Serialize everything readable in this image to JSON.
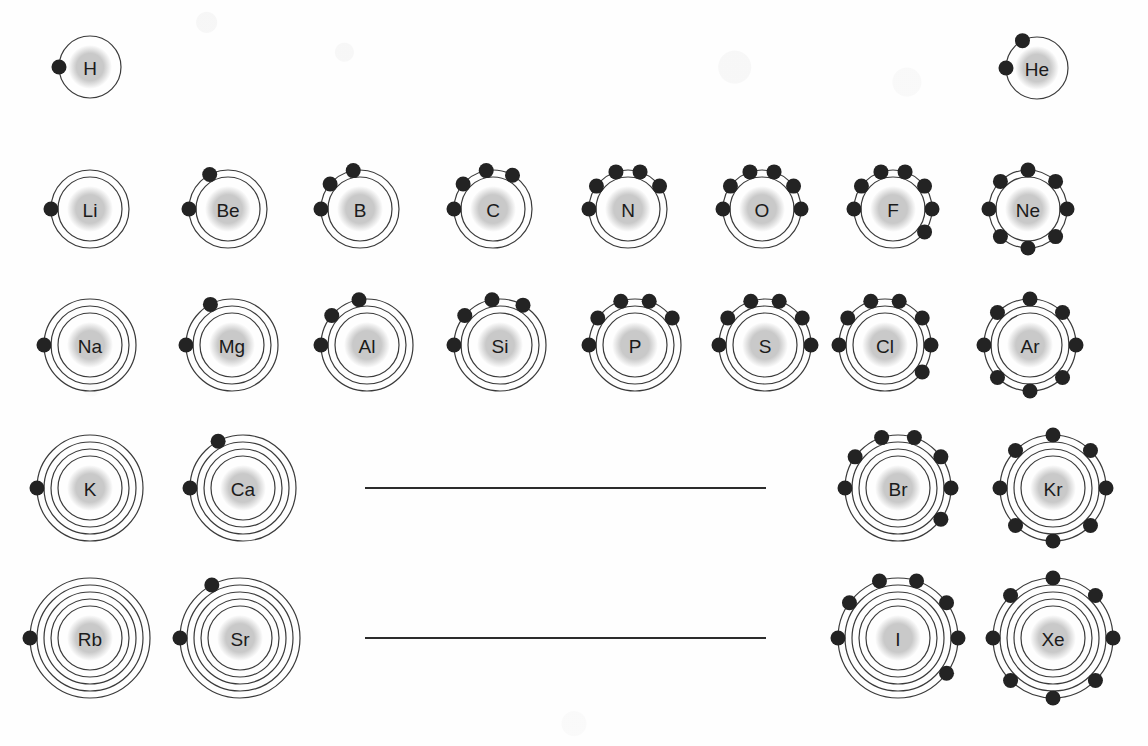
{
  "figure": {
    "kind": "bohr-model-periodic-table",
    "background_color": "#fefefe",
    "nucleus_color": "#c9c9c9",
    "shell_color": "#3a3a3a",
    "electron_color": "#232323",
    "symbol_color": "#1b1b1b",
    "divider_color": "#2c2c2c"
  },
  "dividers": [
    {
      "name": "period-4-transition-gap",
      "x1": 365,
      "x2": 766,
      "y": 488
    },
    {
      "name": "period-5-transition-gap",
      "x1": 365,
      "x2": 766,
      "y": 638
    }
  ],
  "atoms": [
    {
      "symbol": "H",
      "cx": 90,
      "cy": 67,
      "shells": [
        1
      ],
      "nucleus_r": 22,
      "shell_radii": [
        31
      ],
      "font_size": 19
    },
    {
      "symbol": "He",
      "cx": 1037,
      "cy": 68,
      "shells": [
        2
      ],
      "nucleus_r": 22,
      "shell_radii": [
        31
      ],
      "font_size": 19
    },
    {
      "symbol": "Li",
      "cx": 90,
      "cy": 209,
      "shells": [
        2,
        1
      ],
      "nucleus_r": 23,
      "shell_radii": [
        32,
        39
      ],
      "font_size": 19
    },
    {
      "symbol": "Be",
      "cx": 228,
      "cy": 209,
      "shells": [
        2,
        2
      ],
      "nucleus_r": 23,
      "shell_radii": [
        32,
        39
      ],
      "font_size": 19
    },
    {
      "symbol": "B",
      "cx": 360,
      "cy": 209,
      "shells": [
        2,
        3
      ],
      "nucleus_r": 23,
      "shell_radii": [
        32,
        39
      ],
      "font_size": 19
    },
    {
      "symbol": "C",
      "cx": 493,
      "cy": 209,
      "shells": [
        2,
        4
      ],
      "nucleus_r": 23,
      "shell_radii": [
        32,
        39
      ],
      "font_size": 19
    },
    {
      "symbol": "N",
      "cx": 628,
      "cy": 209,
      "shells": [
        2,
        5
      ],
      "nucleus_r": 23,
      "shell_radii": [
        32,
        39
      ],
      "font_size": 19
    },
    {
      "symbol": "O",
      "cx": 762,
      "cy": 209,
      "shells": [
        2,
        6
      ],
      "nucleus_r": 23,
      "shell_radii": [
        32,
        39
      ],
      "font_size": 19
    },
    {
      "symbol": "F",
      "cx": 893,
      "cy": 209,
      "shells": [
        2,
        7
      ],
      "nucleus_r": 23,
      "shell_radii": [
        32,
        39
      ],
      "font_size": 19
    },
    {
      "symbol": "Ne",
      "cx": 1028,
      "cy": 209,
      "shells": [
        2,
        8
      ],
      "nucleus_r": 23,
      "shell_radii": [
        32,
        39
      ],
      "font_size": 19
    },
    {
      "symbol": "Na",
      "cx": 90,
      "cy": 345,
      "shells": [
        2,
        8,
        1
      ],
      "nucleus_r": 23,
      "shell_radii": [
        32,
        39,
        46
      ],
      "font_size": 19
    },
    {
      "symbol": "Mg",
      "cx": 232,
      "cy": 345,
      "shells": [
        2,
        8,
        2
      ],
      "nucleus_r": 23,
      "shell_radii": [
        32,
        39,
        46
      ],
      "font_size": 19
    },
    {
      "symbol": "Al",
      "cx": 367,
      "cy": 345,
      "shells": [
        2,
        8,
        3
      ],
      "nucleus_r": 23,
      "shell_radii": [
        32,
        39,
        46
      ],
      "font_size": 19
    },
    {
      "symbol": "Si",
      "cx": 500,
      "cy": 345,
      "shells": [
        2,
        8,
        4
      ],
      "nucleus_r": 23,
      "shell_radii": [
        32,
        39,
        46
      ],
      "font_size": 19
    },
    {
      "symbol": "P",
      "cx": 635,
      "cy": 345,
      "shells": [
        2,
        8,
        5
      ],
      "nucleus_r": 23,
      "shell_radii": [
        32,
        39,
        46
      ],
      "font_size": 19
    },
    {
      "symbol": "S",
      "cx": 765,
      "cy": 345,
      "shells": [
        2,
        8,
        6
      ],
      "nucleus_r": 23,
      "shell_radii": [
        32,
        39,
        46
      ],
      "font_size": 19
    },
    {
      "symbol": "Cl",
      "cx": 885,
      "cy": 345,
      "shells": [
        2,
        8,
        7
      ],
      "nucleus_r": 23,
      "shell_radii": [
        32,
        39,
        46
      ],
      "font_size": 19
    },
    {
      "symbol": "Ar",
      "cx": 1030,
      "cy": 345,
      "shells": [
        2,
        8,
        8
      ],
      "nucleus_r": 23,
      "shell_radii": [
        32,
        39,
        46
      ],
      "font_size": 19
    },
    {
      "symbol": "K",
      "cx": 90,
      "cy": 488,
      "shells": [
        2,
        8,
        8,
        1
      ],
      "nucleus_r": 23,
      "shell_radii": [
        32,
        39,
        46,
        53
      ],
      "font_size": 19
    },
    {
      "symbol": "Ca",
      "cx": 243,
      "cy": 488,
      "shells": [
        2,
        8,
        8,
        2
      ],
      "nucleus_r": 23,
      "shell_radii": [
        32,
        39,
        46,
        53
      ],
      "font_size": 19
    },
    {
      "symbol": "Br",
      "cx": 898,
      "cy": 488,
      "shells": [
        2,
        8,
        18,
        7
      ],
      "nucleus_r": 23,
      "shell_radii": [
        32,
        39,
        46,
        53
      ],
      "font_size": 19
    },
    {
      "symbol": "Kr",
      "cx": 1053,
      "cy": 488,
      "shells": [
        2,
        8,
        18,
        8
      ],
      "nucleus_r": 23,
      "shell_radii": [
        32,
        39,
        46,
        53
      ],
      "font_size": 19
    },
    {
      "symbol": "Rb",
      "cx": 90,
      "cy": 638,
      "shells": [
        2,
        8,
        18,
        8,
        1
      ],
      "nucleus_r": 23,
      "shell_radii": [
        32,
        39,
        46,
        53,
        60
      ],
      "font_size": 19
    },
    {
      "symbol": "Sr",
      "cx": 240,
      "cy": 638,
      "shells": [
        2,
        8,
        18,
        8,
        2
      ],
      "nucleus_r": 23,
      "shell_radii": [
        32,
        39,
        46,
        53,
        60
      ],
      "font_size": 19
    },
    {
      "symbol": "I",
      "cx": 898,
      "cy": 638,
      "shells": [
        2,
        8,
        18,
        18,
        7
      ],
      "nucleus_r": 23,
      "shell_radii": [
        32,
        39,
        46,
        53,
        60
      ],
      "font_size": 19
    },
    {
      "symbol": "Xe",
      "cx": 1053,
      "cy": 638,
      "shells": [
        2,
        8,
        18,
        18,
        8
      ],
      "nucleus_r": 23,
      "shell_radii": [
        32,
        39,
        46,
        53,
        60
      ],
      "font_size": 19
    }
  ]
}
